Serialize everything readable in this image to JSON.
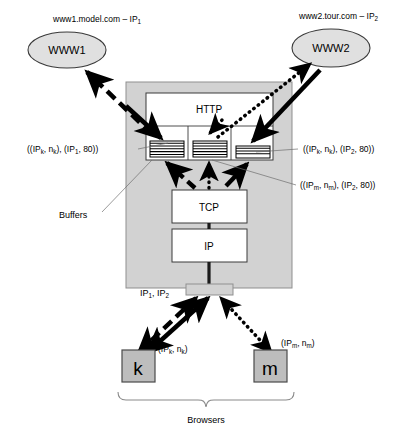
{
  "diagram": {
    "servers": [
      {
        "id": "www1",
        "host_label": "www1.model.com – IP",
        "host_sub": "1",
        "node_label": "WWW1"
      },
      {
        "id": "www2",
        "host_label": "www2.tour.com – IP",
        "host_sub": "2",
        "node_label": "WWW2"
      }
    ],
    "stack": {
      "http_label": "HTTP",
      "tcp_label": "TCP",
      "ip_label": "IP",
      "interface_label": "IP",
      "interface_sub_1": "1",
      "interface_label_2": ", IP",
      "interface_sub_2": "2"
    },
    "buffers": {
      "caption": "Buffers",
      "cells": [
        {
          "id": "buffer-left",
          "stripes": 6
        },
        {
          "id": "buffer-middle",
          "stripes": 6
        },
        {
          "id": "buffer-right",
          "stripes": 4
        }
      ]
    },
    "connection_labels": [
      {
        "id": "conn-left",
        "text_parts": [
          "((IP",
          "k",
          ", n",
          "k",
          "), (IP",
          "1",
          ", 80))"
        ]
      },
      {
        "id": "conn-right-top",
        "text_parts": [
          "((IP",
          "k",
          ", n",
          "k",
          "), (IP",
          "2",
          ", 80))"
        ]
      },
      {
        "id": "conn-right-bottom",
        "text_parts": [
          "((IP",
          "m",
          ", n",
          "m",
          "), (IP",
          "2",
          ", 80))"
        ]
      }
    ],
    "browsers": {
      "caption": "Browsers",
      "items": [
        {
          "id": "browser-k",
          "glyph": "k",
          "addr_parts": [
            "(IP",
            "k",
            ", n",
            "k",
            ")"
          ]
        },
        {
          "id": "browser-m",
          "glyph": "m",
          "addr_parts": [
            "(IP",
            "m",
            ", n",
            "m",
            ")"
          ]
        }
      ]
    },
    "colors": {
      "container_fill": "#d2d2d2",
      "box_fill": "#ffffff",
      "ellipse_fill": "#e0e0e0",
      "browser_fill": "#bdbdbd",
      "line": "#000000"
    }
  }
}
